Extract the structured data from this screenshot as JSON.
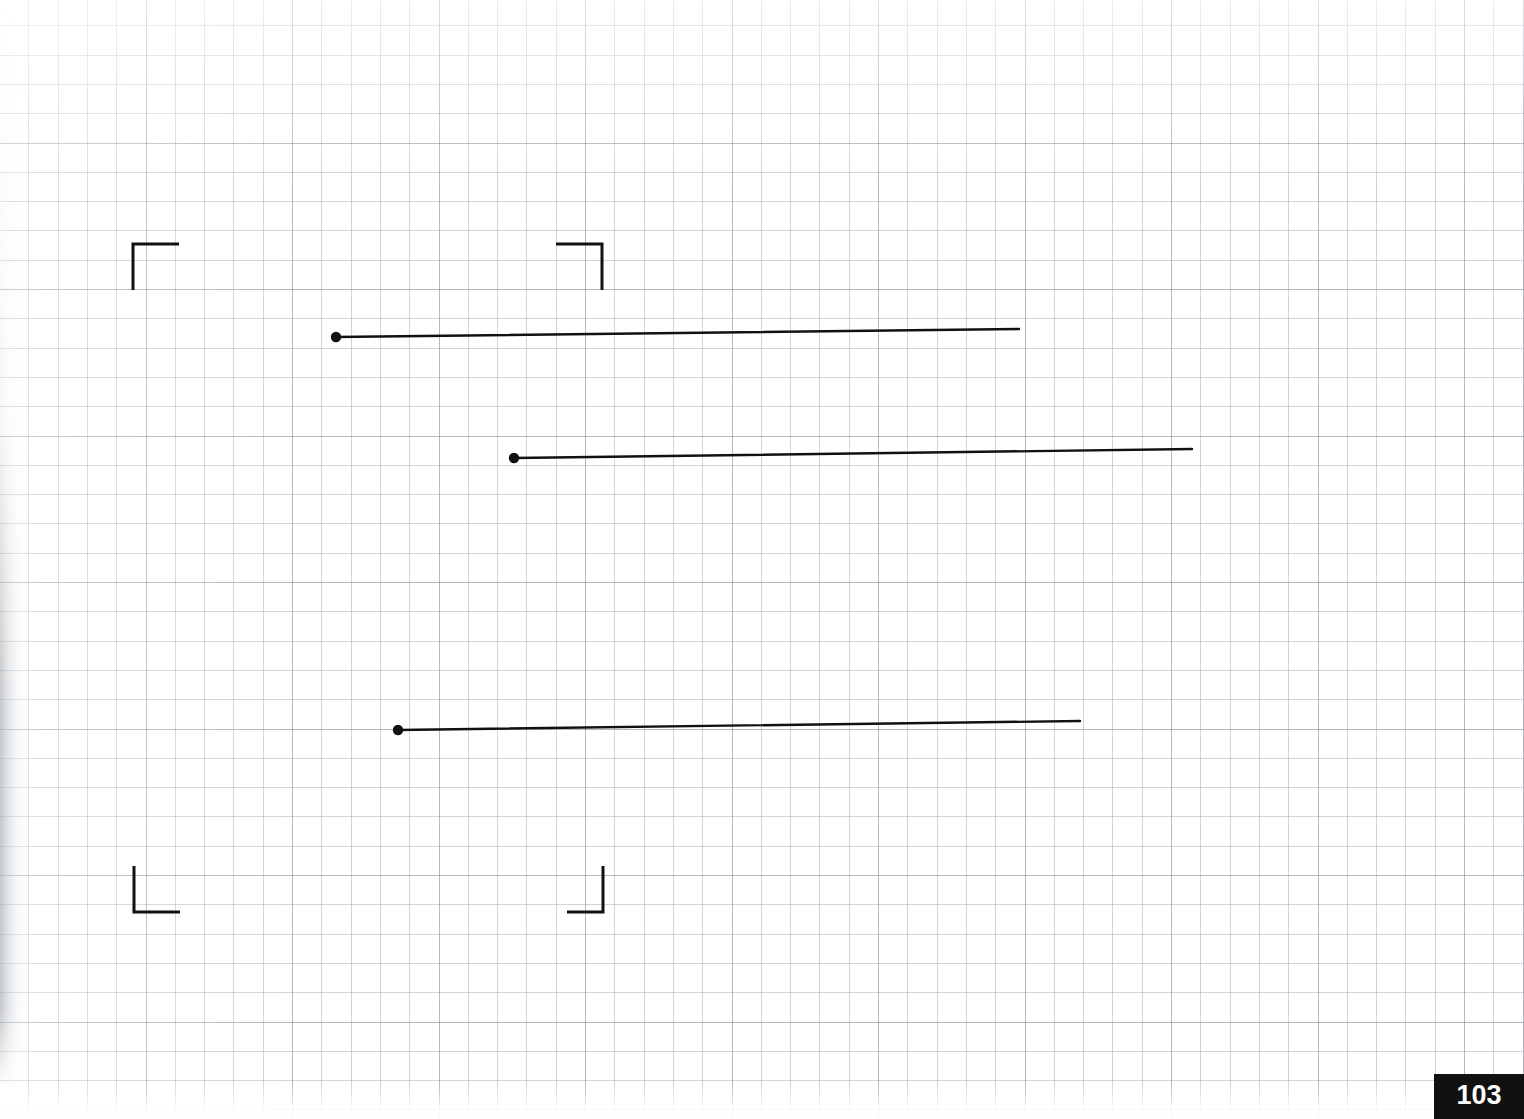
{
  "page": {
    "kind": "scanned-graph-paper-page",
    "width": 1524,
    "height": 1119,
    "background_color": "#ffffff",
    "page_number": "103"
  },
  "grid": {
    "fine_spacing_px": 29.3,
    "coarse_spacing_px": 146.5,
    "line_color": "#7b8490",
    "coarse_line_color": "#6e7887"
  },
  "ink": {
    "color": "#111111",
    "stroke_width_px": 2,
    "dot_radius_px": 5
  },
  "corner_marks": {
    "label": "registration-crop-marks",
    "arm_length_px": 46,
    "items": [
      {
        "name": "top-left",
        "corner_x": 133,
        "corner_y": 244,
        "h_dir": 1,
        "v_dir": 1
      },
      {
        "name": "top-right",
        "corner_x": 602,
        "corner_y": 244,
        "h_dir": -1,
        "v_dir": 1
      },
      {
        "name": "bottom-left",
        "corner_x": 134,
        "corner_y": 912,
        "h_dir": 1,
        "v_dir": -1
      },
      {
        "name": "bottom-right",
        "corner_x": 603,
        "corner_y": 912,
        "h_dir": -1,
        "v_dir": -1
      }
    ]
  },
  "drawn_lines": {
    "label": "three-horizontal-rays-with-origin-dots",
    "count": 3,
    "items": [
      {
        "name": "line-1",
        "x1": 336,
        "y1": 337,
        "x2": 1019,
        "y2": 329,
        "length_px": 683,
        "slope": -0.0117
      },
      {
        "name": "line-2",
        "x1": 514,
        "y1": 458,
        "x2": 1192,
        "y2": 449,
        "length_px": 678,
        "slope": -0.0133
      },
      {
        "name": "line-3",
        "x1": 398,
        "y1": 730,
        "x2": 1080,
        "y2": 721,
        "length_px": 682,
        "slope": -0.0132
      }
    ]
  },
  "page_number_badge": {
    "text": "103",
    "background_color": "#111111",
    "text_color": "#ffffff",
    "width": 90,
    "height": 45
  }
}
